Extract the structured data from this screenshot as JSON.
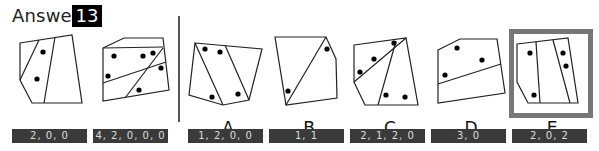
{
  "header": {
    "title": "Answer",
    "question_number": "13"
  },
  "examples": [
    {
      "id": "example-1",
      "counts": "2, 0, 0"
    },
    {
      "id": "example-2",
      "counts": "4, 2, 0, 0, 0"
    }
  ],
  "options": [
    {
      "letter": "A",
      "counts": "1, 2, 0, 0"
    },
    {
      "letter": "B",
      "counts": "1, 1"
    },
    {
      "letter": "C",
      "counts": "2, 1, 2, 0"
    },
    {
      "letter": "D",
      "counts": "3, 0"
    },
    {
      "letter": "E",
      "counts": "2, 0, 2",
      "selected": true
    }
  ],
  "colors": {
    "label_bg": "#3a3a3a",
    "selection_border": "#777777",
    "badge_bg": "#000000"
  }
}
